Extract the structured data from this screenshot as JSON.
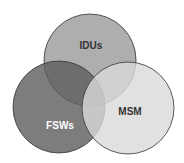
{
  "diagram": {
    "type": "venn",
    "sets": [
      {
        "label": "IDUs",
        "cx": 90,
        "cy": 60,
        "r": 46,
        "fill": "#9a9a9a",
        "text_color": "#333333",
        "lx": 91,
        "ly": 49
      },
      {
        "label": "FSWs",
        "cx": 59,
        "cy": 107,
        "r": 46,
        "fill": "#5c5c5c",
        "text_color": "#ffffff",
        "lx": 60,
        "ly": 129
      },
      {
        "label": "MSM",
        "cx": 128,
        "cy": 108,
        "r": 46,
        "fill": "#d9d9d9",
        "text_color": "#333333",
        "lx": 130,
        "ly": 115
      }
    ]
  }
}
